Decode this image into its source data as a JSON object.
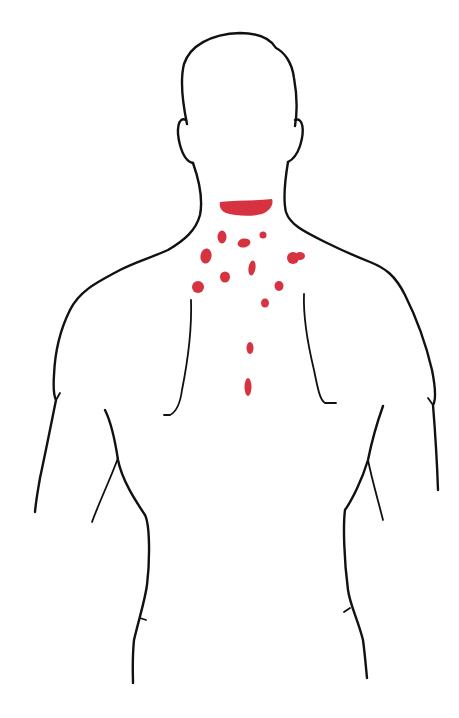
{
  "figure": {
    "colors": {
      "background": "#ffffff",
      "outline": "#111111",
      "spots": "#d6323f"
    },
    "spots": [
      {
        "id": "neck-band",
        "shape": "band"
      },
      {
        "id": "s1",
        "cx": 222,
        "cy": 237,
        "rx": 4.5,
        "ry": 6.5,
        "rot": 0
      },
      {
        "id": "s2",
        "cx": 244,
        "cy": 243,
        "rx": 6.5,
        "ry": 4.5,
        "rot": -10
      },
      {
        "id": "s3",
        "cx": 263,
        "cy": 235,
        "rx": 3.5,
        "ry": 3.5,
        "rot": 0
      },
      {
        "id": "s4",
        "cx": 206,
        "cy": 256,
        "rx": 5.5,
        "ry": 7.5,
        "rot": 10
      },
      {
        "id": "s5a",
        "cx": 293,
        "cy": 258,
        "rx": 6,
        "ry": 6,
        "rot": 0
      },
      {
        "id": "s5b",
        "cx": 300,
        "cy": 256,
        "rx": 5,
        "ry": 4,
        "rot": 0
      },
      {
        "id": "s6",
        "cx": 252,
        "cy": 268,
        "rx": 3.5,
        "ry": 7.5,
        "rot": 8
      },
      {
        "id": "s7",
        "cx": 225,
        "cy": 277,
        "rx": 5,
        "ry": 5.5,
        "rot": 0
      },
      {
        "id": "s8",
        "cx": 198,
        "cy": 287,
        "rx": 6,
        "ry": 6,
        "rot": 0
      },
      {
        "id": "s9",
        "cx": 279,
        "cy": 286,
        "rx": 4.5,
        "ry": 5,
        "rot": 0
      },
      {
        "id": "s10",
        "cx": 265,
        "cy": 303,
        "rx": 4,
        "ry": 4.5,
        "rot": 0
      },
      {
        "id": "s11",
        "cx": 250,
        "cy": 348,
        "rx": 3.5,
        "ry": 6,
        "rot": 0
      },
      {
        "id": "s12",
        "cx": 248,
        "cy": 387,
        "rx": 3.5,
        "ry": 9,
        "rot": 0
      }
    ]
  }
}
